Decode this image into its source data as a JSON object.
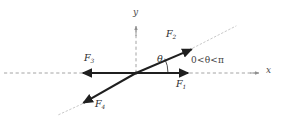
{
  "figure": {
    "width": 286,
    "height": 126,
    "background": "#ffffff",
    "ink_color": "#2e2e2e",
    "axis_color": "#8f8f8f",
    "guide_color": "#bdbdbd"
  },
  "axes": {
    "x_label": "x",
    "y_label": "y",
    "origin": {
      "x": 136,
      "y": 73
    },
    "x_axis": {
      "x1": 4,
      "y1": 73,
      "x2": 258,
      "y2": 73,
      "style": "dashed",
      "arrow": "right"
    },
    "y_axis": {
      "x1": 136,
      "y1": 28,
      "x2": 136,
      "y2": 73,
      "style": "dashed",
      "arrow": "up"
    }
  },
  "vectors": [
    {
      "id": "F1",
      "label_main": "F",
      "label_sub": "1",
      "direction": "right along positive x-axis",
      "tip": {
        "x": 190,
        "y": 73
      },
      "label_pos": {
        "x": 178,
        "y": 80
      }
    },
    {
      "id": "F2",
      "label_main": "F",
      "label_sub": "2",
      "direction": "up-right at angle theta above positive x-axis",
      "tip": {
        "x": 193,
        "y": 48
      },
      "label_pos": {
        "x": 168,
        "y": 33
      }
    },
    {
      "id": "F3",
      "label_main": "F",
      "label_sub": "3",
      "direction": "left along negative x-axis",
      "tip": {
        "x": 80,
        "y": 73
      },
      "label_pos": {
        "x": 86,
        "y": 57
      }
    },
    {
      "id": "F4",
      "label_main": "F",
      "label_sub": "4",
      "direction": "down-left opposite to F2",
      "tip": {
        "x": 81,
        "y": 104
      },
      "label_pos": {
        "x": 96,
        "y": 103
      }
    }
  ],
  "angle": {
    "symbol": "θ",
    "label_pos": {
      "x": 158,
      "y": 58
    },
    "arc_radius": 26,
    "between": [
      "positive x-axis",
      "F2"
    ]
  },
  "annotation": {
    "range_text": "0<θ<π",
    "pos": {
      "x": 192,
      "y": 60
    }
  },
  "guides": [
    {
      "name": "diagonal-extension-upper-right",
      "from": {
        "x": 193,
        "y": 48
      },
      "to": {
        "x": 234,
        "y": 27
      },
      "style": "dotted"
    },
    {
      "name": "diagonal-extension-lower-left",
      "from": {
        "x": 81,
        "y": 104
      },
      "to": {
        "x": 60,
        "y": 114
      },
      "style": "dotted"
    }
  ]
}
